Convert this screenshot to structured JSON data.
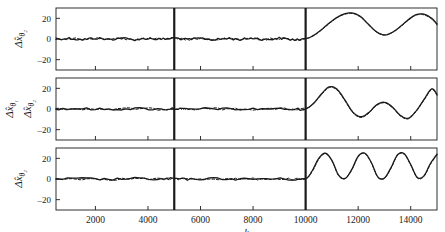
{
  "figure": {
    "width": 445,
    "height": 232,
    "background": "#ffffff",
    "ink_color": "#1a1a1a"
  },
  "axis": {
    "xlabel": "k",
    "xticks": [
      2000,
      4000,
      6000,
      8000,
      10000,
      12000,
      14000
    ],
    "xtick_labels": [
      "2000",
      "4000",
      "6000",
      "8000",
      "10000",
      "12000",
      "14000"
    ],
    "xlim": [
      500,
      15000
    ],
    "yticks": [
      20,
      0,
      -20
    ],
    "ytick_labels": [
      "20",
      "0",
      "-20"
    ],
    "ylim": [
      -30,
      30
    ],
    "grid": false,
    "legend": "none"
  },
  "markers": {
    "vline_1_k": 5000,
    "vline_2_k": 10000,
    "vline_color": "#1a1a1a"
  },
  "panels": [
    {
      "id": "panel-1",
      "ylabel_main": "Δx̂",
      "ylabel_sub": "θ₂",
      "ylabel_full": "Δx̂_θ₂"
    },
    {
      "id": "panel-2",
      "ylabel_main": "Δx̂",
      "ylabel_sub": "θ₁",
      "ylabel_main2": "Δx̂",
      "ylabel_sub2": "θ₂",
      "ylabel_full": "Δx̂_θ₁, Δx̂_θ₂"
    },
    {
      "id": "panel-3",
      "ylabel_main": "Δx̂",
      "ylabel_sub": "θ₂",
      "ylabel_full": "Δx̂_θ₂"
    }
  ],
  "chart_data": {
    "type": "line",
    "title": "",
    "xlabel": "k",
    "ylabel": "",
    "xlim": [
      500,
      15000
    ],
    "ylim": [
      -30,
      30
    ],
    "grid": false,
    "legend": "none",
    "annotations": [
      {
        "type": "vline",
        "x": 5000,
        "style": "solid",
        "width": 2.2
      },
      {
        "type": "vline",
        "x": 10000,
        "style": "solid",
        "width": 2.2
      }
    ],
    "subplots": [
      {
        "name": "panel-1",
        "ylabel": "Δx̂_θ₂",
        "yticks": [
          20,
          0,
          -20
        ],
        "series": [
          {
            "name": "true",
            "style": "solid",
            "x": [
              500,
              1000,
              1500,
              2000,
              2500,
              3000,
              3500,
              4000,
              4500,
              5000,
              5500,
              6000,
              6500,
              7000,
              7500,
              8000,
              8500,
              9000,
              9500,
              10000,
              10300,
              10600,
              10900,
              11200,
              11500,
              11800,
              12100,
              12400,
              12700,
              13000,
              13300,
              13600,
              13900,
              14200,
              14500,
              14800,
              15000
            ],
            "values": [
              0,
              0.6,
              -0.5,
              0.8,
              -0.4,
              0.7,
              -0.6,
              0.5,
              -0.3,
              0.9,
              -0.5,
              0.6,
              -0.7,
              0.4,
              -0.4,
              0.8,
              -0.5,
              0.7,
              -0.6,
              0.4,
              3.5,
              9.0,
              15.5,
              21.0,
              24.5,
              25.0,
              21.5,
              14.0,
              7.0,
              4.0,
              6.5,
              12.0,
              18.5,
              23.5,
              24.0,
              20.0,
              14.5
            ]
          },
          {
            "name": "estimate",
            "style": "dashed",
            "x": [
              500,
              1000,
              1500,
              2000,
              2500,
              3000,
              3500,
              4000,
              4500,
              5000,
              5500,
              6000,
              6500,
              7000,
              7500,
              8000,
              8500,
              9000,
              9500,
              10000,
              10300,
              10600,
              10900,
              11200,
              11500,
              11800,
              12100,
              12400,
              12700,
              13000,
              13300,
              13600,
              13900,
              14200,
              14500,
              14800,
              15000
            ],
            "values": [
              0,
              0.5,
              -0.4,
              0.7,
              -0.3,
              0.6,
              -0.5,
              0.4,
              -0.3,
              0.8,
              -0.4,
              0.5,
              -0.6,
              0.3,
              -0.3,
              0.7,
              -0.4,
              0.6,
              -0.5,
              0.3,
              3.2,
              8.6,
              15.0,
              20.5,
              24.0,
              24.6,
              21.0,
              13.6,
              6.6,
              3.7,
              6.2,
              11.6,
              18.0,
              23.0,
              23.4,
              19.2,
              13.6
            ]
          }
        ]
      },
      {
        "name": "panel-2",
        "ylabel": "Δx̂_θ₁, Δx̂_θ₂",
        "yticks": [
          20,
          0,
          -20
        ],
        "series": [
          {
            "name": "true",
            "style": "solid",
            "x": [
              500,
              1500,
              2500,
              3500,
              4500,
              5000,
              5500,
              6500,
              7500,
              8500,
              9500,
              10000,
              10300,
              10600,
              10900,
              11200,
              11500,
              11800,
              12100,
              12400,
              12700,
              13000,
              13300,
              13600,
              13900,
              14200,
              14500,
              14800,
              15000
            ],
            "values": [
              0,
              0.3,
              -0.3,
              0.4,
              -0.2,
              0.5,
              -0.3,
              0.4,
              -0.3,
              0.3,
              -0.2,
              0.3,
              5.5,
              14.5,
              21.5,
              19.0,
              8.5,
              -3.0,
              -7.5,
              -3.5,
              4.0,
              6.5,
              2.0,
              -6.0,
              -9.0,
              -2.0,
              9.0,
              19.5,
              14.0
            ]
          },
          {
            "name": "estimate",
            "style": "dashed",
            "x": [
              500,
              1500,
              2500,
              3500,
              4500,
              5000,
              5500,
              6500,
              7500,
              8500,
              9500,
              10000,
              10300,
              10600,
              10900,
              11200,
              11500,
              11800,
              12100,
              12400,
              12700,
              13000,
              13300,
              13600,
              13900,
              14200,
              14500,
              14800,
              15000
            ],
            "values": [
              0,
              0.2,
              -0.2,
              0.3,
              -0.2,
              0.4,
              -0.2,
              0.3,
              -0.2,
              0.2,
              -0.2,
              0.2,
              5.0,
              13.8,
              20.8,
              18.2,
              7.8,
              -3.6,
              -8.2,
              -4.2,
              3.4,
              6.0,
              1.4,
              -6.6,
              -9.6,
              -2.6,
              8.4,
              18.8,
              13.2
            ]
          }
        ]
      },
      {
        "name": "panel-3",
        "ylabel": "Δx̂_θ₂",
        "yticks": [
          20,
          0,
          -20
        ],
        "series": [
          {
            "name": "true",
            "style": "solid",
            "x": [
              500,
              1500,
              2500,
              3500,
              4500,
              5000,
              5500,
              6500,
              7500,
              8500,
              9500,
              10000,
              10250,
              10500,
              10750,
              11000,
              11250,
              11500,
              11750,
              12000,
              12250,
              12500,
              12750,
              13000,
              13250,
              13500,
              13750,
              14000,
              14250,
              14500,
              14750,
              15000
            ],
            "values": [
              0,
              0.3,
              -0.3,
              0.4,
              -0.2,
              0.4,
              -0.3,
              0.4,
              -0.2,
              0.3,
              -0.2,
              0.3,
              8.0,
              20.0,
              25.0,
              18.0,
              4.0,
              0.5,
              9.0,
              22.0,
              25.0,
              16.0,
              2.0,
              1.0,
              11.0,
              23.5,
              24.5,
              14.0,
              1.5,
              3.0,
              15.0,
              24.0
            ]
          },
          {
            "name": "estimate",
            "style": "dashed",
            "x": [
              500,
              1500,
              2500,
              3500,
              4500,
              5000,
              5500,
              6500,
              7500,
              8500,
              9500,
              10000,
              10250,
              10500,
              10750,
              11000,
              11250,
              11500,
              11750,
              12000,
              12250,
              12500,
              12750,
              13000,
              13250,
              13500,
              13750,
              14000,
              14250,
              14500,
              14750,
              15000
            ],
            "values": [
              0,
              0.2,
              -0.2,
              0.3,
              -0.2,
              0.3,
              -0.2,
              0.3,
              -0.2,
              0.2,
              -0.2,
              0.2,
              7.2,
              19.2,
              24.4,
              17.6,
              3.4,
              0.2,
              8.4,
              21.4,
              24.6,
              15.6,
              1.6,
              0.6,
              10.4,
              23.0,
              24.0,
              13.4,
              1.0,
              2.4,
              14.2,
              23.4
            ]
          }
        ]
      }
    ]
  }
}
